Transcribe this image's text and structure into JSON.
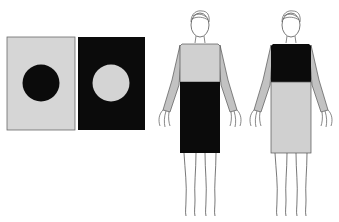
{
  "colors": {
    "background": "#ffffff",
    "light": "#d4d4d4",
    "dark": "#0a0a0a",
    "sleeve": "#c2c2c2",
    "outline": "#555555"
  },
  "panels": [
    {
      "id": "panel-light-with-dark-circle",
      "background": "light",
      "circle": "dark"
    },
    {
      "id": "panel-dark-with-light-circle",
      "background": "dark",
      "circle": "light"
    }
  ],
  "figures": [
    {
      "id": "figure-light-top-dark-skirt",
      "top": "light",
      "skirt": "dark"
    },
    {
      "id": "figure-dark-top-light-skirt",
      "top": "dark",
      "skirt": "light"
    }
  ]
}
